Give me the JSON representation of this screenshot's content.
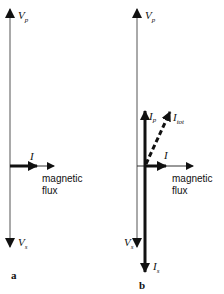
{
  "diagram": {
    "panels": [
      {
        "id": "a",
        "label": "a",
        "vp_label": "V",
        "vp_sub": "p",
        "vs_label": "V",
        "vs_sub": "s",
        "i_label": "I",
        "flux_label_1": "magnetic",
        "flux_label_2": "flux"
      },
      {
        "id": "b",
        "label": "b",
        "vp_label": "V",
        "vp_sub": "p",
        "vs_label": "V",
        "vs_sub": "s",
        "i_label": "I",
        "ip_label": "I",
        "ip_sub": "p",
        "itot_label": "I",
        "itot_sub": "tot",
        "is_label": "I",
        "is_sub": "s",
        "flux_label_1": "magnetic",
        "flux_label_2": "flux"
      }
    ],
    "colors": {
      "line": "#111111",
      "thin_line": "#555555",
      "background": "#ffffff"
    }
  }
}
